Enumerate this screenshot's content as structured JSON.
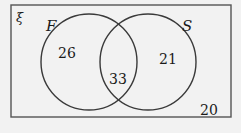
{
  "venn": {
    "universal_symbol": "ξ",
    "sets": [
      {
        "label": "F",
        "only_value": "26"
      },
      {
        "label": "S",
        "only_value": "21"
      }
    ],
    "intersection_value": "33",
    "outside_value": "20"
  },
  "colors": {
    "background": "#f2f2f2",
    "stroke": "#3a3a3a",
    "text": "#1a1a1a"
  }
}
